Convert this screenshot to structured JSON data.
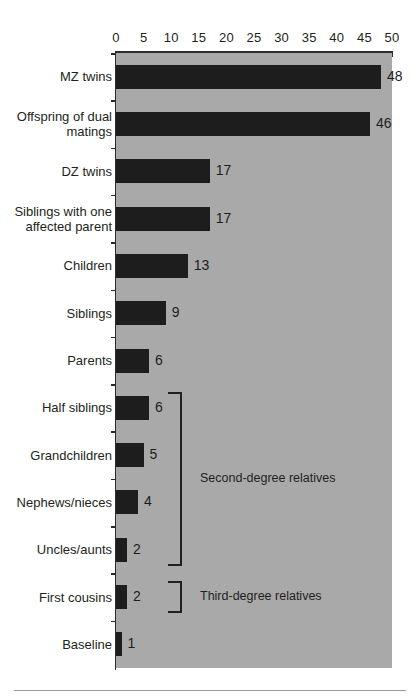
{
  "chart_data": {
    "type": "bar",
    "orientation": "horizontal",
    "title": "",
    "subtitle": "",
    "xlabel": "",
    "ylabel": "",
    "xlim": [
      0,
      50
    ],
    "xticks": [
      0,
      5,
      10,
      15,
      20,
      25,
      30,
      35,
      40,
      45,
      50
    ],
    "grid": false,
    "legend": null,
    "categories": [
      "MZ twins",
      "Offspring of dual\nmatings",
      "DZ twins",
      "Siblings with one\naffected parent",
      "Children",
      "Siblings",
      "Parents",
      "Half siblings",
      "Grandchildren",
      "Nephews/nieces",
      "Uncles/aunts",
      "First cousins",
      "Baseline"
    ],
    "values": [
      48,
      46,
      17,
      17,
      13,
      9,
      6,
      6,
      5,
      4,
      2,
      2,
      1
    ],
    "value_labels": [
      "48",
      "46",
      "17",
      "17",
      "13",
      "9",
      "6",
      "6",
      "5",
      "4",
      "2",
      "2",
      "1"
    ],
    "annotations": [
      {
        "label": "Second-degree relatives",
        "from_category": "Half siblings",
        "to_category": "Uncles/aunts",
        "from_index": 7,
        "to_index": 10
      },
      {
        "label": "Third-degree relatives",
        "from_category": "First cousins",
        "to_category": "First cousins",
        "from_index": 11,
        "to_index": 11
      }
    ],
    "colors": {
      "bar": "#1d1d1d",
      "plot_background": "#a9a9a9",
      "page_background": "#ffffff",
      "axis": "#2b2b2b",
      "text": "#231f20"
    }
  }
}
